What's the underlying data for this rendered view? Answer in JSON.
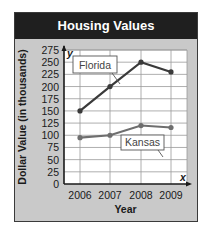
{
  "title": "Housing Values",
  "chart_data": {
    "type": "line",
    "title": "Housing Values",
    "xlabel": "Year",
    "ylabel": "Dollar Value (in thousands)",
    "categories": [
      "2006",
      "2007",
      "2008",
      "2009"
    ],
    "series": [
      {
        "name": "Florida",
        "values": [
          150,
          200,
          250,
          230
        ],
        "color": "#3a3a3a"
      },
      {
        "name": "Kansas",
        "values": [
          95,
          100,
          120,
          116
        ],
        "color": "#6e6e6e"
      }
    ],
    "yticks": [
      0,
      25,
      50,
      75,
      100,
      125,
      150,
      175,
      200,
      225,
      250,
      275
    ],
    "ylim": [
      0,
      275
    ],
    "grid": true,
    "axis_letters": {
      "x": "x",
      "y": "y"
    },
    "legend_position": "callout labels on lines"
  }
}
